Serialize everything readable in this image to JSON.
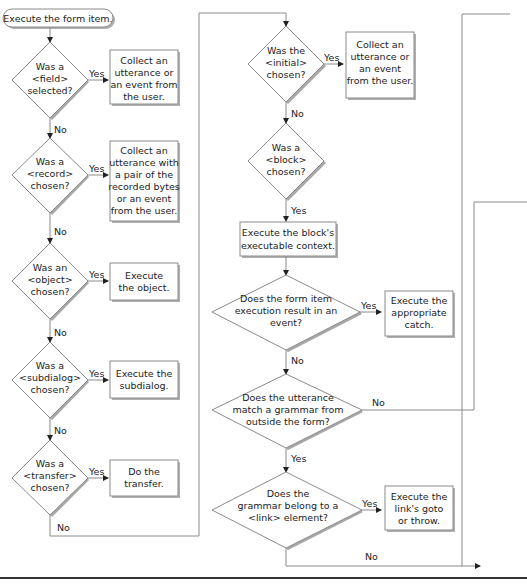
{
  "start": {
    "label": "Execute the form item."
  },
  "left_column": [
    {
      "question": [
        "Was a",
        "<field>",
        "selected?"
      ],
      "yes_label": "Yes",
      "no_label": "No",
      "action": [
        "Collect an",
        "utterance or",
        "an event from",
        "the user."
      ]
    },
    {
      "question": [
        "Was a",
        "<record>",
        "chosen?"
      ],
      "yes_label": "Yes",
      "no_label": "No",
      "action": [
        "Collect an",
        "utterance with",
        "a pair of the",
        "recorded bytes",
        "or an event",
        "from the user."
      ]
    },
    {
      "question": [
        "Was an",
        "<object>",
        "chosen?"
      ],
      "yes_label": "Yes",
      "no_label": "No",
      "action": [
        "Execute",
        "the object."
      ]
    },
    {
      "question": [
        "Was a",
        "<subdialog>",
        "chosen?"
      ],
      "yes_label": "Yes",
      "no_label": "No",
      "action": [
        "Execute the",
        "subdialog."
      ]
    },
    {
      "question": [
        "Was a",
        "<transfer>",
        "chosen?"
      ],
      "yes_label": "Yes",
      "no_label": "No",
      "action": [
        "Do the",
        "transfer."
      ]
    }
  ],
  "right_column": {
    "initial": {
      "question": [
        "Was the",
        "<initial>",
        "chosen?"
      ],
      "yes_label": "Yes",
      "no_label": "No",
      "action": [
        "Collect an",
        "utterance or",
        "an event",
        "from the user."
      ]
    },
    "block": {
      "question": [
        "Was a",
        "<block>",
        "chosen?"
      ],
      "yes_label": "Yes",
      "action": [
        "Execute the block's",
        "executable context."
      ]
    },
    "event": {
      "question": [
        "Does the form item",
        "execution result in an",
        "event?"
      ],
      "yes_label": "Yes",
      "no_label": "No",
      "action": [
        "Execute the",
        "appropriate",
        "catch."
      ]
    },
    "utterance": {
      "question": [
        "Does the utterance",
        "match a grammar from",
        "outside the form?"
      ],
      "yes_label": "Yes",
      "no_label": "No"
    },
    "link": {
      "question": [
        "Does the",
        "grammar belong to a",
        "<link> element?"
      ],
      "yes_label": "Yes",
      "no_label": "No",
      "action": [
        "Execute the",
        "link's goto",
        "or throw."
      ]
    }
  }
}
